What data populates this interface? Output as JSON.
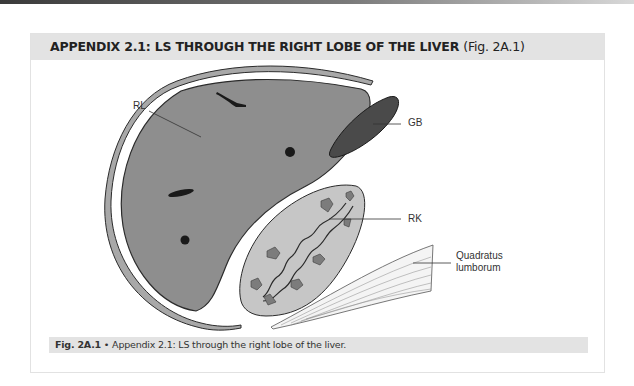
{
  "header": {
    "title": "APPENDIX 2.1: LS THROUGH THE RIGHT LOBE OF THE LIVER",
    "figure_ref": "(Fig. 2A.1)"
  },
  "figure": {
    "labels": {
      "rl": "RL",
      "gb": "GB",
      "rk": "RK",
      "ql_line1": "Quadratus",
      "ql_line2": "lumborum"
    },
    "colors": {
      "liver": "#8e8e8e",
      "gallbladder": "#4a4a4a",
      "kidney": "#c6c6c6",
      "kidney_pyramids": "#7c7c7c",
      "capsule": "#a8a8a8",
      "outline": "#2b2b2b"
    }
  },
  "caption": {
    "label": "Fig. 2A.1",
    "separator": "•",
    "text": "Appendix 2.1: LS through the right lobe of the liver."
  }
}
